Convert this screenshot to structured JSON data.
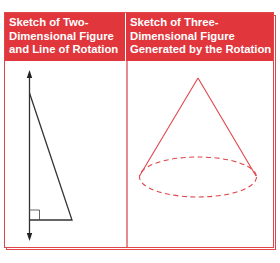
{
  "table": {
    "headers": [
      "Sketch of Two-\nDimensional Figure\nand Line of Rotation",
      "Sketch of Three-\nDimensional Figure\nGenerated by the Rotation"
    ],
    "colors": {
      "header_fill": "#e0363c",
      "border": "#e0454a",
      "cone_stroke": "#e0454a",
      "triangle_stroke": "#333333"
    }
  },
  "left_figure": {
    "shape": "right-triangle",
    "line_of_rotation": "vertical-double-arrow",
    "right_angle_marker": true
  },
  "right_figure": {
    "shape": "cone",
    "base": "dashed-ellipse"
  }
}
